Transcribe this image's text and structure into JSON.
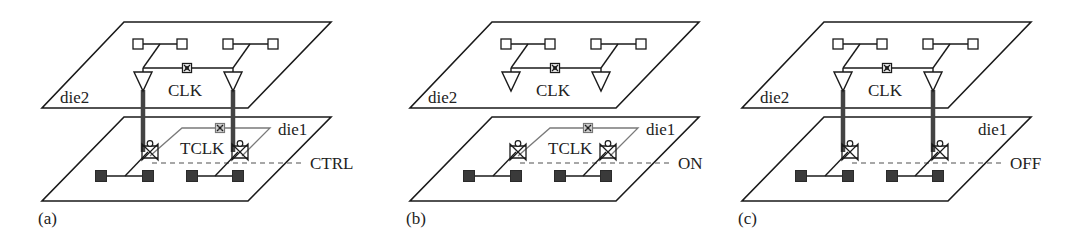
{
  "figure": {
    "panels": [
      {
        "id": "a",
        "caption": "(a)",
        "offset_x": 0,
        "top_die_label": "die2",
        "bottom_die_label": "die1",
        "top_clock_label": "CLK",
        "bottom_clock_label": "TCLK",
        "control_label": "CTRL",
        "show_tsv": true,
        "show_tclk": true,
        "show_top_buffers_connected": true
      },
      {
        "id": "b",
        "caption": "(b)",
        "offset_x": 368,
        "top_die_label": "die2",
        "bottom_die_label": "die1",
        "top_clock_label": "CLK",
        "bottom_clock_label": "TCLK",
        "control_label": "ON",
        "show_tsv": false,
        "show_tclk": true,
        "show_top_buffers_connected": false
      },
      {
        "id": "c",
        "caption": "(c)",
        "offset_x": 700,
        "top_die_label": "die2",
        "bottom_die_label": "die1",
        "top_clock_label": "CLK",
        "bottom_clock_label": "",
        "control_label": "OFF",
        "show_tsv": true,
        "show_tclk": false,
        "show_top_buffers_connected": true
      }
    ],
    "legend_semantics": {
      "open-square-icon": "flip-flop on die2",
      "filled-square-icon": "flip-flop on die1",
      "triangle-icon": "clock buffer",
      "x-box-icon": "clock source / mux",
      "transmission-gate-icon": "transmission gate controlled by CTRL",
      "thick-vertical-line": "through-silicon via (TSV)"
    },
    "colors": {
      "line": "#1a1a1a",
      "tsv": "#444444",
      "dashed_control": "#8a8a8a",
      "tclk_wire": "#7a7a7a",
      "filled_ff": "#3a3a3a"
    }
  }
}
